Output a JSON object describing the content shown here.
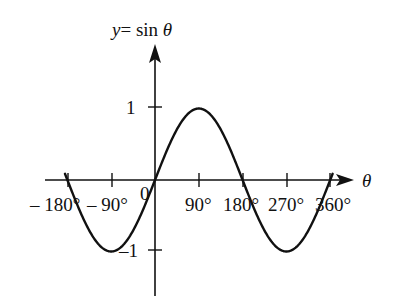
{
  "chart_data": {
    "type": "line",
    "xlabel": "θ",
    "ylabel": "y = sin θ",
    "function": "sin",
    "x_unit": "degrees",
    "xlim": [
      -185,
      365
    ],
    "ylim": [
      -1,
      1
    ],
    "x_ticks": [
      -180,
      -90,
      90,
      180,
      270,
      360
    ],
    "x_tick_labels": [
      "– 180°",
      "– 90°",
      "90°",
      "180°",
      "270°",
      "360°"
    ],
    "y_ticks": [
      1,
      -1
    ],
    "y_tick_labels": [
      "1",
      "–1"
    ],
    "origin_label": "0",
    "grid": false,
    "legend": null,
    "series": [
      {
        "name": "sin θ",
        "x": [
          -180,
          -135,
          -90,
          -45,
          0,
          45,
          90,
          135,
          180,
          225,
          270,
          315,
          360
        ],
        "values": [
          0,
          -0.707,
          -1,
          -0.707,
          0,
          0.707,
          1,
          0.707,
          0,
          -0.707,
          -1,
          -0.707,
          0
        ]
      }
    ],
    "line_color": "#111111"
  },
  "labels": {
    "y_axis_title_y": "y",
    "y_axis_title_eq": "= sin ",
    "y_axis_title_theta": "θ",
    "x_axis_title": "θ",
    "origin": "0",
    "tick_neg180": "– 180°",
    "tick_neg90": "– 90°",
    "tick_90": "90°",
    "tick_180": "180°",
    "tick_270": "270°",
    "tick_360": "360°",
    "tick_y1": "1",
    "tick_yneg1": "–1"
  }
}
